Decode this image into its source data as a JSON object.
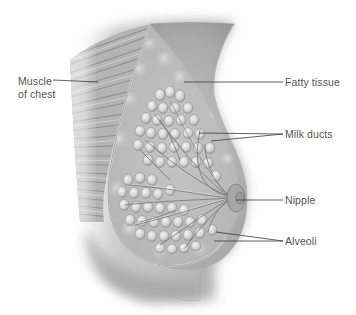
{
  "diagram": {
    "labels": [
      {
        "id": "muscle",
        "lines": [
          "Muscle",
          "of chest"
        ],
        "x": 18,
        "y": 76
      },
      {
        "id": "fatty-tissue",
        "lines": [
          "Fatty tissue"
        ],
        "x": 285,
        "y": 77
      },
      {
        "id": "milk-ducts",
        "lines": [
          "Milk ducts"
        ],
        "x": 285,
        "y": 128
      },
      {
        "id": "nipple",
        "lines": [
          "Nipple"
        ],
        "x": 285,
        "y": 194
      },
      {
        "id": "alveoli",
        "lines": [
          "Alveoli"
        ],
        "x": 285,
        "y": 235
      }
    ],
    "colors": {
      "background": "#ffffff",
      "label_text": "#555555",
      "leader_line": "#3a3a3a",
      "skin_light": "#d8d8d8",
      "skin_dark": "#8a8a8a",
      "tissue": "#bdbdbd",
      "alveoli": "#e6e6e6",
      "muscle": "#a8a8a8"
    }
  }
}
